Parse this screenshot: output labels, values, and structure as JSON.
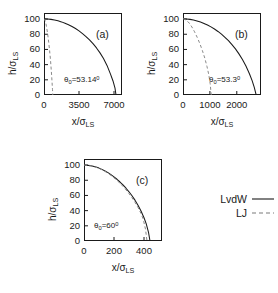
{
  "figure": {
    "axis_labels": {
      "x_prefix": "x/",
      "x_sigma": "σ",
      "x_subscript": "LS",
      "y_prefix": "h/",
      "y_sigma": "σ",
      "y_subscript": "LS"
    },
    "legend": {
      "entries": [
        {
          "label": "LvdW",
          "style": "solid",
          "icon": "solid-line-icon"
        },
        {
          "label": "LJ",
          "style": "dashed",
          "icon": "dashed-line-icon"
        }
      ]
    }
  },
  "chart_data": [
    {
      "type": "line",
      "panel": "a",
      "tag": "(a)",
      "annotation": "θ₀=53.14⁰",
      "annotation_parts": {
        "theta": "θ",
        "sub": "0",
        "eq": "=",
        "value": "53.14",
        "deg": "0"
      },
      "xlabel": "x/σLS",
      "ylabel": "h/σLS",
      "xlim": [
        0,
        7800
      ],
      "ylim": [
        0,
        108
      ],
      "xticks": [
        0,
        3500,
        7000
      ],
      "xticklabels": [
        "0",
        "3500",
        "7000"
      ],
      "yticks": [
        0,
        20,
        40,
        60,
        80,
        100
      ],
      "yticklabels": [
        "0",
        "20",
        "40",
        "60",
        "80",
        "100"
      ],
      "grid": false,
      "series": [
        {
          "name": "LvdW",
          "style": "solid",
          "x": [
            0,
            350,
            700,
            1050,
            1400,
            1750,
            2100,
            2450,
            2800,
            3150,
            3500,
            3850,
            4200,
            4550,
            4900,
            5250,
            5600,
            5950,
            6300,
            6650,
            6900,
            7100,
            7200
          ],
          "y": [
            100.5,
            100.2,
            99.6,
            98.8,
            97.7,
            96.3,
            94.6,
            92.6,
            90.2,
            87.5,
            84.4,
            80.9,
            77.0,
            72.6,
            67.6,
            62.0,
            55.5,
            48.0,
            39.0,
            27.5,
            18.5,
            9.0,
            0
          ]
        },
        {
          "name": "LJ",
          "style": "dashed",
          "x": [
            0,
            60,
            120,
            200,
            290,
            380,
            470,
            560,
            650,
            730,
            800,
            850,
            880
          ],
          "y": [
            100.5,
            99.5,
            97.5,
            93.5,
            87.0,
            79.0,
            69.5,
            58.5,
            46.0,
            32.0,
            18.0,
            7.0,
            0
          ]
        }
      ]
    },
    {
      "type": "line",
      "panel": "b",
      "tag": "(b)",
      "annotation": "θ₀=53.3⁰",
      "annotation_parts": {
        "theta": "θ",
        "sub": "0",
        "eq": "=",
        "value": "53.3",
        "deg": "0"
      },
      "xlabel": "x/σLS",
      "ylabel": "h/σLS",
      "xlim": [
        0,
        2900
      ],
      "ylim": [
        0,
        108
      ],
      "xticks": [
        0,
        1000,
        2000
      ],
      "xticklabels": [
        "0",
        "1000",
        "2000"
      ],
      "yticks": [
        0,
        20,
        40,
        60,
        80,
        100
      ],
      "yticklabels": [
        "0",
        "20",
        "40",
        "60",
        "80",
        "100"
      ],
      "grid": false,
      "series": [
        {
          "name": "LvdW",
          "style": "solid",
          "x": [
            0,
            130,
            260,
            390,
            520,
            650,
            780,
            910,
            1040,
            1170,
            1300,
            1430,
            1560,
            1690,
            1820,
            1950,
            2080,
            2210,
            2340,
            2470,
            2570,
            2650,
            2720
          ],
          "y": [
            100.5,
            100.2,
            99.6,
            98.8,
            97.6,
            96.1,
            94.3,
            92.2,
            89.7,
            86.9,
            83.7,
            80.1,
            76.0,
            71.5,
            66.4,
            60.7,
            54.2,
            46.8,
            38.2,
            28.0,
            19.0,
            10.0,
            0
          ]
        },
        {
          "name": "LJ",
          "style": "dashed",
          "x": [
            0,
            70,
            140,
            230,
            330,
            430,
            530,
            630,
            720,
            810,
            890,
            960,
            1010,
            1050
          ],
          "y": [
            100.5,
            99.6,
            98.0,
            94.8,
            89.6,
            83.2,
            75.8,
            67.4,
            58.6,
            48.6,
            37.8,
            26.5,
            15.0,
            0
          ]
        }
      ]
    },
    {
      "type": "line",
      "panel": "c",
      "tag": "(c)",
      "annotation": "θ₀=60⁰",
      "annotation_parts": {
        "theta": "θ",
        "sub": "0",
        "eq": "=",
        "value": "60",
        "deg": "0"
      },
      "xlabel": "x/σLS",
      "ylabel": "h/σLS",
      "xlim": [
        0,
        520
      ],
      "ylim": [
        0,
        108
      ],
      "xticks": [
        0,
        200,
        400
      ],
      "xticklabels": [
        "0",
        "200",
        "400"
      ],
      "yticks": [
        0,
        20,
        40,
        60,
        80,
        100
      ],
      "yticklabels": [
        "0",
        "20",
        "40",
        "60",
        "80",
        "100"
      ],
      "grid": false,
      "series": [
        {
          "name": "LvdW",
          "style": "solid",
          "x": [
            0,
            20,
            40,
            60,
            80,
            100,
            120,
            140,
            160,
            180,
            200,
            220,
            240,
            260,
            280,
            300,
            320,
            340,
            360,
            380,
            400,
            415,
            430,
            440
          ],
          "y": [
            100.0,
            99.8,
            99.3,
            98.5,
            97.4,
            96.0,
            94.3,
            92.3,
            90.0,
            87.4,
            84.5,
            81.3,
            77.7,
            73.8,
            69.5,
            64.8,
            59.6,
            53.8,
            47.2,
            39.6,
            30.6,
            22.5,
            11.5,
            0
          ]
        },
        {
          "name": "LJ",
          "style": "dashed",
          "x": [
            0,
            20,
            40,
            60,
            80,
            100,
            120,
            140,
            160,
            180,
            200,
            220,
            240,
            260,
            280,
            300,
            320,
            340,
            360,
            380,
            395,
            410,
            420
          ],
          "y": [
            100.0,
            99.7,
            99.2,
            98.3,
            97.1,
            95.6,
            93.8,
            91.6,
            89.1,
            86.3,
            83.2,
            79.8,
            76.0,
            71.9,
            67.3,
            62.4,
            56.9,
            50.9,
            44.1,
            36.2,
            28.5,
            15.5,
            0
          ]
        }
      ]
    }
  ]
}
